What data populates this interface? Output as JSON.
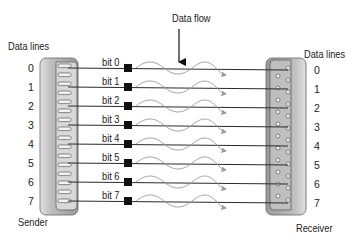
{
  "title": "Data flow",
  "sender": {
    "heading": "Data lines",
    "caption": "Sender",
    "lines": [
      "0",
      "1",
      "2",
      "3",
      "4",
      "5",
      "6",
      "7"
    ]
  },
  "receiver": {
    "heading": "Data lines",
    "caption": "Receiver",
    "lines": [
      "0",
      "1",
      "2",
      "3",
      "4",
      "5",
      "6",
      "7"
    ]
  },
  "bits": [
    "bit 0",
    "bit 1",
    "bit 2",
    "bit 3",
    "bit 4",
    "bit 5",
    "bit 6",
    "bit 7"
  ],
  "colors": {
    "wire": "#2a2a2a",
    "flow_arrow": "#9a9a9a",
    "connector_body": "#c9c9c9",
    "connector_dark": "#8c8c8c",
    "bit_marker": "#111111"
  }
}
